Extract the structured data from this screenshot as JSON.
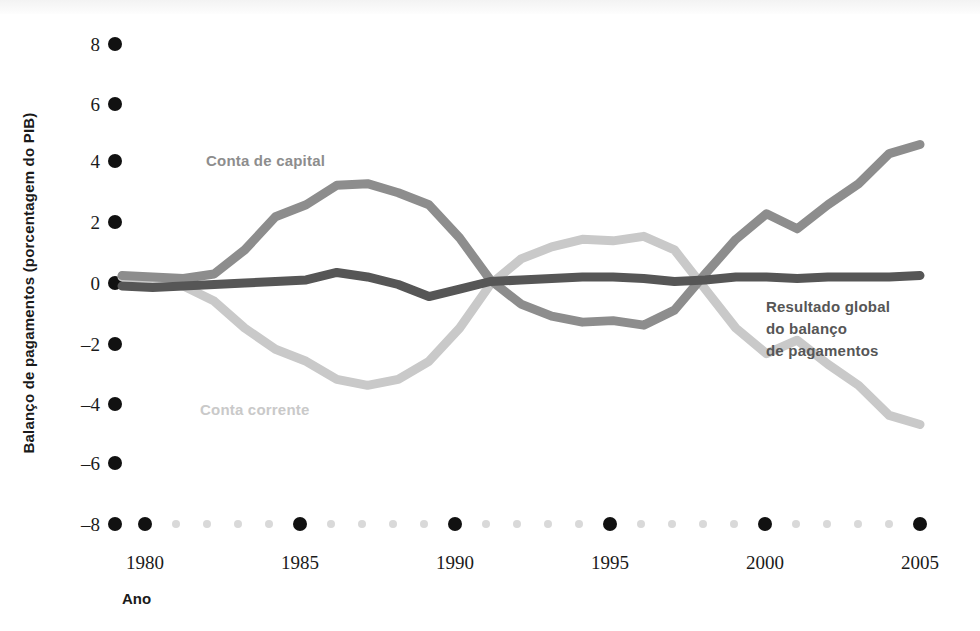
{
  "chart_data": {
    "type": "line",
    "title": "",
    "xlabel": "Ano",
    "ylabel": "Balanço de pagamentos (porcentagem do PIB)",
    "xlim": [
      1979,
      2005
    ],
    "ylim": [
      -8,
      8
    ],
    "x_ticks": [
      1980,
      1985,
      1990,
      1995,
      2000,
      2005
    ],
    "x_tick_labels": [
      "1980",
      "1985",
      "1990",
      "1995",
      "2000",
      "2005"
    ],
    "y_ticks": [
      8,
      6,
      4,
      2,
      0,
      -2,
      -4,
      -6,
      -8
    ],
    "y_tick_labels": [
      "8",
      "6",
      "4",
      "2",
      "0",
      "–2",
      "–4",
      "–6",
      "–8"
    ],
    "grid": false,
    "legend_position": "inline-annotations",
    "x": [
      1979,
      1980,
      1981,
      1982,
      1983,
      1984,
      1985,
      1986,
      1987,
      1988,
      1989,
      1990,
      1991,
      1992,
      1993,
      1994,
      1995,
      1996,
      1997,
      1998,
      1999,
      2000,
      2001,
      2002,
      2003,
      2004,
      2005
    ],
    "series": [
      {
        "name": "Conta de capital",
        "color": "#8d8d8d",
        "values": [
          0.25,
          0.2,
          0.15,
          0.3,
          1.1,
          2.2,
          2.6,
          3.25,
          3.3,
          3.0,
          2.6,
          1.5,
          0.1,
          -0.7,
          -1.1,
          -1.3,
          -1.25,
          -1.4,
          -0.9,
          0.3,
          1.45,
          2.3,
          1.8,
          2.6,
          3.3,
          4.3,
          4.6
        ]
      },
      {
        "name": "Conta corrente",
        "color": "#c9c9c9",
        "values": [
          0.2,
          0.15,
          -0.1,
          -0.6,
          -1.5,
          -2.2,
          -2.6,
          -3.2,
          -3.4,
          -3.2,
          -2.6,
          -1.5,
          -0.05,
          0.8,
          1.2,
          1.45,
          1.4,
          1.55,
          1.1,
          -0.2,
          -1.5,
          -2.35,
          -1.9,
          -2.7,
          -3.4,
          -4.4,
          -4.7
        ]
      },
      {
        "name": "Resultado global do balanço de pagamentos",
        "color": "#565656",
        "values": [
          -0.1,
          -0.15,
          -0.1,
          -0.05,
          0.0,
          0.05,
          0.1,
          0.35,
          0.2,
          -0.05,
          -0.45,
          -0.2,
          0.05,
          0.1,
          0.15,
          0.2,
          0.2,
          0.15,
          0.05,
          0.1,
          0.2,
          0.2,
          0.15,
          0.2,
          0.2,
          0.2,
          0.25
        ]
      }
    ],
    "annotations": [
      {
        "text": "Conta de capital",
        "x": 1984.5,
        "y": 4.1,
        "color": "#8d8d8d"
      },
      {
        "text": "Conta corrente",
        "x": 1984.2,
        "y": -4.3,
        "color": "#c9c9c9"
      },
      {
        "text_lines": [
          "Resultado global",
          "do balanço",
          "de pagamentos"
        ],
        "x": 2000.0,
        "y": -0.9,
        "color": "#565656"
      }
    ]
  },
  "axes": {
    "y_title": "Balanço de pagamentos (porcentagem do PIB)",
    "x_title": "Ano"
  },
  "ticks": {
    "y": [
      "8",
      "6",
      "4",
      "2",
      "0",
      "–2",
      "–4",
      "–6",
      "–8"
    ],
    "x": [
      "1980",
      "1985",
      "1990",
      "1995",
      "2000",
      "2005"
    ]
  },
  "labels": {
    "capital": "Conta de capital",
    "current": "Conta corrente",
    "overall_line1": "Resultado global",
    "overall_line2": "do balanço",
    "overall_line3": "de pagamentos"
  },
  "colors": {
    "capital": "#8d8d8d",
    "current": "#c9c9c9",
    "overall": "#565656",
    "tick_dot_major": "#111111",
    "tick_dot_minor": "#d9d9d9",
    "text": "#1a1a1a"
  }
}
